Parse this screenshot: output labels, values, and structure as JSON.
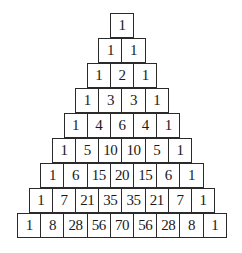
{
  "diagram": {
    "type": "pascal-triangle",
    "rows": [
      [
        1
      ],
      [
        1,
        1
      ],
      [
        1,
        2,
        1
      ],
      [
        1,
        3,
        3,
        1
      ],
      [
        1,
        4,
        6,
        4,
        1
      ],
      [
        1,
        5,
        10,
        10,
        5,
        1
      ],
      [
        1,
        6,
        15,
        20,
        15,
        6,
        1
      ],
      [
        1,
        7,
        21,
        35,
        35,
        21,
        7,
        1
      ],
      [
        1,
        8,
        28,
        56,
        70,
        56,
        28,
        8,
        1
      ]
    ]
  },
  "layout": {
    "center_x": 122,
    "top_y": 13,
    "cell_width": 24.2,
    "row_height": 25,
    "border_color": "#2a2a2a",
    "text_color": "#1a1a1a",
    "background": "#ffffff"
  }
}
